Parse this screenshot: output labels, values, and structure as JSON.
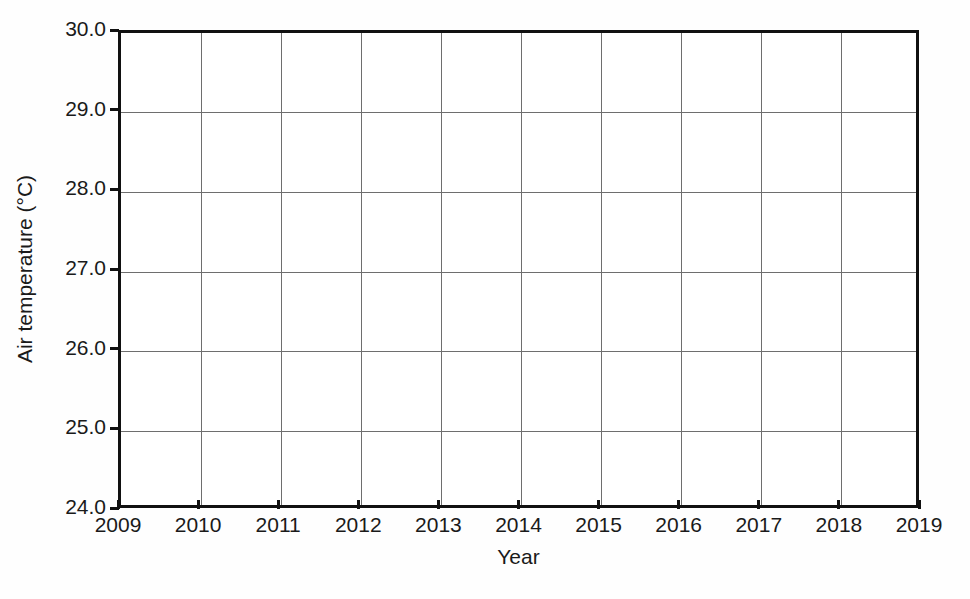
{
  "chart_data": {
    "type": "line",
    "title": "",
    "subtitle": "",
    "xlabel": "Year",
    "ylabel": "Air temperature (°C)",
    "xlim": [
      2009,
      2019
    ],
    "ylim": [
      24.0,
      30.0
    ],
    "x_tick_labels": [
      "2009",
      "2010",
      "2011",
      "2012",
      "2013",
      "2014",
      "2015",
      "2016",
      "2017",
      "2018",
      "2019"
    ],
    "x_tick_values": [
      2009,
      2010,
      2011,
      2012,
      2013,
      2014,
      2015,
      2016,
      2017,
      2018,
      2019
    ],
    "y_tick_labels": [
      "24.0",
      "25.0",
      "26.0",
      "27.0",
      "28.0",
      "29.0",
      "30.0"
    ],
    "y_tick_values": [
      24.0,
      25.0,
      26.0,
      27.0,
      28.0,
      29.0,
      30.0
    ],
    "x_tick_step": 1,
    "y_tick_step": 1.0,
    "grid": true,
    "grid_axis": "both",
    "legend": false,
    "legend_position": "none",
    "series": [],
    "values": [],
    "categories": [],
    "annotations": [],
    "colors": {
      "axis": "#111111",
      "grid": "#6e6e6e",
      "text": "#1a1a1a",
      "plot_background": "#ffffff",
      "figure_background": "#fefefe"
    }
  }
}
